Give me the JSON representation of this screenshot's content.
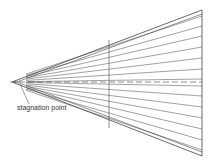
{
  "diagram": {
    "label": "stagnation point",
    "colors": {
      "line": "#444444",
      "background": "#ffffff"
    },
    "apex": [
      12,
      82
    ],
    "right_x": 202,
    "middle_x": 109,
    "top_right_y": 10,
    "bottom_right_y": 156,
    "streamline_end_ys": [
      16,
      26,
      36,
      47,
      58,
      69,
      79,
      86,
      96,
      107,
      118,
      129,
      140,
      150
    ]
  }
}
